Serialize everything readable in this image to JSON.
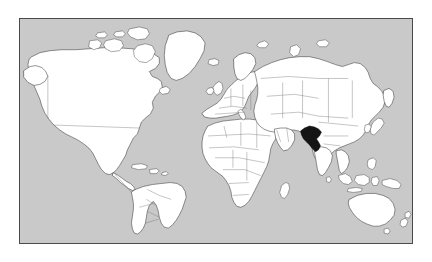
{
  "map": {
    "title": "World locator map",
    "projection": "equirectangular",
    "highlighted_country": "Pakistan",
    "colors": {
      "ocean": "#c9c9c9",
      "land": "#ffffff",
      "coastline": "#3a3a3a",
      "country_border": "#6e6e6e",
      "highlight": "#151515",
      "frame": "#4a4a4a",
      "background": "#ffffff"
    },
    "frame": {
      "x": 19,
      "y": 18,
      "width": 394,
      "height": 226,
      "border_width": 1
    },
    "legend": [],
    "labels": [],
    "regions_shown": [
      "North America",
      "South America",
      "Greenland",
      "Europe",
      "Africa",
      "Asia",
      "Australia",
      "New Zealand",
      "Indonesia",
      "Japan"
    ],
    "highlight_marker": {
      "name": "Pakistan",
      "approx_x": 296,
      "approx_y": 128
    }
  }
}
